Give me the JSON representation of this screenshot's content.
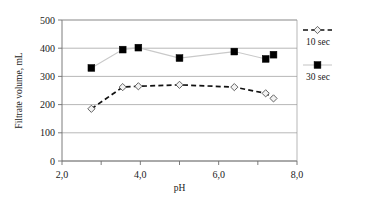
{
  "chart_data": {
    "type": "line",
    "title": "",
    "xlabel": "pH",
    "ylabel": "Filtrate volume, mL",
    "xlim": [
      2.0,
      8.0
    ],
    "ylim": [
      0,
      500
    ],
    "ytick_step": 100,
    "xtick_step": 1.0,
    "grid": true,
    "legend_position": "right",
    "xticklabels": [
      "2,0",
      "",
      "4,0",
      "",
      "6,0",
      "",
      "8,0"
    ],
    "xtickvalues": [
      2.0,
      3.0,
      4.0,
      5.0,
      6.0,
      7.0,
      8.0
    ],
    "yticklabels": [
      "0",
      "100",
      "200",
      "300",
      "400",
      "500"
    ],
    "ytickvalues": [
      0,
      100,
      200,
      300,
      400,
      500
    ],
    "series": [
      {
        "name": "10 sec",
        "marker": "open-diamond",
        "linestyle": "dashed",
        "line_color": "#111111",
        "marker_face": "#f2f2f2",
        "x": [
          2.75,
          3.55,
          3.95,
          5.0,
          6.4,
          7.2,
          7.4
        ],
        "values": [
          185,
          262,
          265,
          270,
          262,
          240,
          222
        ]
      },
      {
        "name": "30 sec",
        "marker": "filled-square",
        "linestyle": "solid",
        "line_color": "#c9c9c9",
        "marker_face": "#000000",
        "x": [
          2.75,
          3.55,
          3.95,
          5.0,
          6.4,
          7.2,
          7.4
        ],
        "values": [
          330,
          395,
          402,
          365,
          388,
          362,
          377
        ]
      }
    ]
  },
  "legend": {
    "entries": [
      {
        "label": "10 sec"
      },
      {
        "label": "30 sec"
      }
    ]
  },
  "axes": {
    "x_title": "pH",
    "y_title": "Filtrate volume, mL"
  }
}
